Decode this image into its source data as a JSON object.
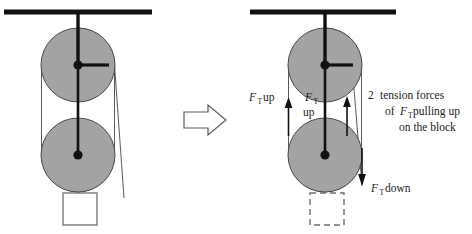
{
  "figure": {
    "type": "physics-free-body-diagram",
    "colors": {
      "pulley_fill": "#a3a3a3",
      "pulley_stroke": "#4a4a4a",
      "heavy_line": "#111111",
      "rope_line": "#555555",
      "block_stroke": "#666666",
      "arrow_outline": "#555555",
      "text": "#1a1a1a",
      "background": "#ffffff"
    }
  },
  "left_panel": {
    "name": "original-pulley-setup",
    "ceiling": {
      "x1": 4,
      "x2": 152,
      "y": 12
    },
    "support_rod": {
      "x": 78,
      "y1": 12,
      "y2": 65
    },
    "pulleys": [
      {
        "name": "upper-pulley",
        "cx": 78,
        "cy": 65,
        "r": 37
      },
      {
        "name": "lower-pulley",
        "cx": 78,
        "cy": 155,
        "r": 37
      }
    ],
    "block": {
      "x": 63,
      "y": 193,
      "w": 34,
      "h": 32,
      "style": "solid"
    },
    "spoke": {
      "x1": 78,
      "y1": 65,
      "x2": 108,
      "y2": 65
    }
  },
  "right_panel": {
    "name": "force-analysis-setup",
    "ceiling": {
      "x1": 250,
      "x2": 396,
      "y": 12
    },
    "support_rod": {
      "x": 325,
      "y1": 12,
      "y2": 65
    },
    "pulleys": [
      {
        "name": "upper-pulley",
        "cx": 325,
        "cy": 65,
        "r": 37
      },
      {
        "name": "lower-pulley",
        "cx": 325,
        "cy": 155,
        "r": 37
      }
    ],
    "block": {
      "x": 310,
      "y": 193,
      "w": 34,
      "h": 32,
      "style": "dashed"
    },
    "spoke": {
      "x1": 325,
      "y1": 65,
      "x2": 352,
      "y2": 65
    }
  },
  "transition_arrow": {
    "name": "implies-arrow",
    "direction": "right",
    "x": 183,
    "y": 108,
    "width": 42,
    "height": 24
  },
  "labels": {
    "left_tension": {
      "symbol": "F",
      "subscript": "T",
      "word": "up",
      "full_text": "F_T up",
      "x": 250,
      "y": 101
    },
    "middle_tension": {
      "symbol": "F",
      "subscript": "T",
      "word": "up",
      "full_text": "F_T up",
      "x": 306,
      "y": 104
    },
    "bottom_tension": {
      "symbol": "F",
      "subscript": "T",
      "word": "down",
      "full_text": "F_T down",
      "x": 372,
      "y": 192
    },
    "note": {
      "name": "tension-forces-note",
      "line1_count": "2",
      "line1": "tension forces",
      "line2_prefix": "of",
      "line2_symbol": "F",
      "line2_subscript": "T",
      "line2_suffix": "pulling up",
      "line3": "on the block",
      "full_text": "2 tension forces of F_T pulling up on the block",
      "x": 368,
      "y": 98
    }
  },
  "force_arrows": [
    {
      "name": "left-rope-up-arrow",
      "direction": "up",
      "x": 288,
      "tip_y": 99,
      "tail_y": 136
    },
    {
      "name": "middle-rope-up-arrow",
      "direction": "up",
      "x": 347,
      "tip_y": 98,
      "tail_y": 136
    },
    {
      "name": "right-rope-down-arrow",
      "direction": "down",
      "x": 362,
      "tip_y": 185,
      "tail_y": 148
    }
  ]
}
